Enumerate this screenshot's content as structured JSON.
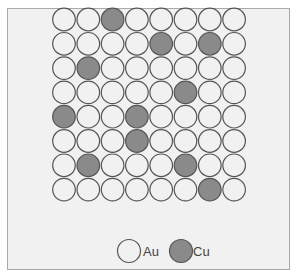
{
  "figure": {
    "grid": {
      "rows": 8,
      "cols": 8
    },
    "atoms": [
      [
        "Au",
        "Au",
        "Cu",
        "Au",
        "Au",
        "Au",
        "Au",
        "Au"
      ],
      [
        "Au",
        "Au",
        "Au",
        "Au",
        "Cu",
        "Au",
        "Cu",
        "Au"
      ],
      [
        "Au",
        "Cu",
        "Au",
        "Au",
        "Au",
        "Au",
        "Au",
        "Au"
      ],
      [
        "Au",
        "Au",
        "Au",
        "Au",
        "Au",
        "Cu",
        "Au",
        "Au"
      ],
      [
        "Cu",
        "Au",
        "Au",
        "Cu",
        "Au",
        "Au",
        "Au",
        "Au"
      ],
      [
        "Au",
        "Au",
        "Au",
        "Cu",
        "Au",
        "Au",
        "Au",
        "Au"
      ],
      [
        "Au",
        "Cu",
        "Au",
        "Au",
        "Au",
        "Cu",
        "Au",
        "Au"
      ],
      [
        "Au",
        "Au",
        "Au",
        "Au",
        "Au",
        "Au",
        "Cu",
        "Au"
      ]
    ],
    "species": {
      "Au": {
        "label": "Au",
        "fill": "#f1f1f1",
        "stroke": "#555555"
      },
      "Cu": {
        "label": "Cu",
        "fill": "#8a8a8a",
        "stroke": "#555555"
      }
    }
  },
  "legend": {
    "items": [
      {
        "species": "Au",
        "label": "Au"
      },
      {
        "species": "Cu",
        "label": "Cu"
      }
    ]
  }
}
